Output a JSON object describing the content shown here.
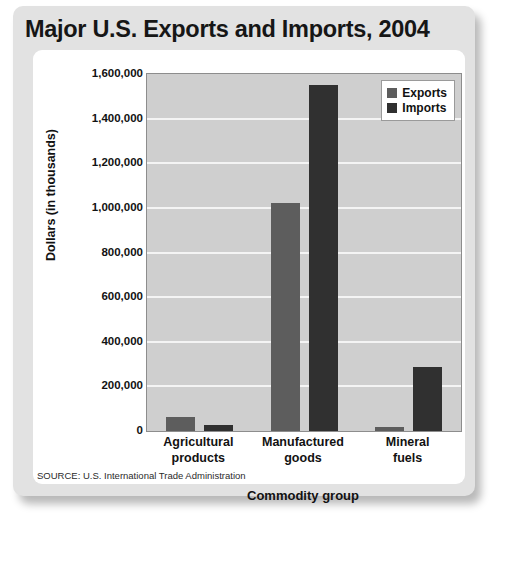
{
  "chart_data": {
    "type": "bar",
    "title": "Major U.S. Exports and Imports, 2004",
    "xlabel": "Commodity group",
    "ylabel": "Dollars (in thousands)",
    "categories": [
      "Agricultural products",
      "Manufactured goods",
      "Mineral fuels"
    ],
    "category_lines": [
      [
        "Agricultural",
        "products"
      ],
      [
        "Manufactured",
        "goods"
      ],
      [
        "Mineral",
        "fuels"
      ]
    ],
    "series": [
      {
        "name": "Exports",
        "color": "#5d5d5d",
        "values": [
          62000,
          1020000,
          20000
        ]
      },
      {
        "name": "Imports",
        "color": "#303030",
        "values": [
          28000,
          1550000,
          285000
        ]
      }
    ],
    "ylim": [
      0,
      1600000
    ],
    "ytick_values": [
      0,
      200000,
      400000,
      600000,
      800000,
      1000000,
      1200000,
      1400000,
      1600000
    ],
    "ytick_labels": [
      "0",
      "200,000",
      "400,000",
      "600,000",
      "800,000",
      "1,000,000",
      "1,200,000",
      "1,400,000",
      "1,600,000"
    ],
    "grid": true,
    "legend_position": "top-right",
    "plot_background": "#cfcfcf",
    "gridline_color": "#f4f4f4",
    "source": "SOURCE: U.S. International Trade Administration"
  }
}
